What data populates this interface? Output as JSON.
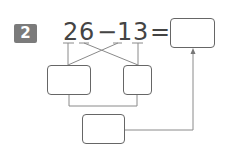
{
  "problem": {
    "number": "2",
    "expression": {
      "d1": "2",
      "d2": "6",
      "op": "−",
      "d3": "1",
      "d4": "3",
      "eq": "="
    },
    "answer_box_value": "",
    "split_box_left_value": "",
    "split_box_right_value": "",
    "sum_box_value": ""
  },
  "colors": {
    "badge": "#7b7b7b",
    "line": "#888888",
    "text": "#444444"
  }
}
